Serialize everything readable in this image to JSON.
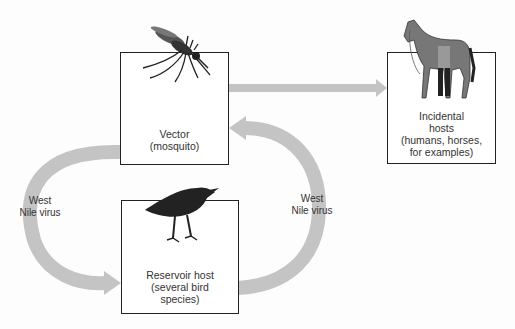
{
  "diagram": {
    "nodes": [
      {
        "id": "vector",
        "label": "Vector\n(mosquito)",
        "icon": "mosquito-icon"
      },
      {
        "id": "reservoir",
        "label": "Reservoir host\n(several bird\nspecies)",
        "icon": "bird-icon"
      },
      {
        "id": "incidental",
        "label": "Incidental\nhosts\n(humans, horses,\nfor examples)",
        "icon": "horse-and-human-icon"
      }
    ],
    "edges": [
      {
        "from": "vector",
        "to": "reservoir",
        "label": "West\nNile virus"
      },
      {
        "from": "reservoir",
        "to": "vector",
        "label": "West\nNile virus"
      },
      {
        "from": "vector",
        "to": "incidental",
        "label": ""
      }
    ],
    "colors": {
      "arrow": "#c4c4c4",
      "box_border": "#222222",
      "text": "#333333"
    }
  }
}
